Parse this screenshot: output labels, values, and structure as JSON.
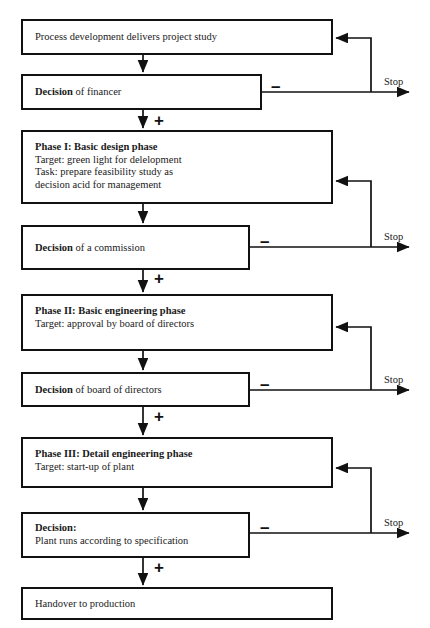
{
  "diagram": {
    "branch_positive": "+",
    "branch_negative": "−",
    "stop_label": "Stop"
  },
  "nodes": [
    {
      "id": "process-development",
      "kind": "process",
      "lines": [
        {
          "text": "Process development delivers project study",
          "bold": false
        }
      ]
    },
    {
      "id": "decision-financer",
      "kind": "decision",
      "lines": [
        {
          "text": "Decision",
          "bold": true,
          "suffix": " of financer"
        }
      ]
    },
    {
      "id": "phase-1",
      "kind": "process",
      "lines": [
        {
          "text": "Phase I: Basic design phase",
          "bold": true
        },
        {
          "text": "Target: green light for delelopment",
          "bold": false
        },
        {
          "text": "Task: prepare feasibility study as",
          "bold": false
        },
        {
          "text": "decision acid for management",
          "bold": false
        }
      ]
    },
    {
      "id": "decision-commission",
      "kind": "decision",
      "lines": [
        {
          "text": "Decision",
          "bold": true,
          "suffix": " of a commission"
        }
      ]
    },
    {
      "id": "phase-2",
      "kind": "process",
      "lines": [
        {
          "text": "Phase II: Basic engineering phase",
          "bold": true
        },
        {
          "text": "Target: approval by board of directors",
          "bold": false
        }
      ]
    },
    {
      "id": "decision-board",
      "kind": "decision",
      "lines": [
        {
          "text": "Decision",
          "bold": true,
          "suffix": " of board of directors"
        }
      ]
    },
    {
      "id": "phase-3",
      "kind": "process",
      "lines": [
        {
          "text": "Phase III: Detail engineering phase",
          "bold": true
        },
        {
          "text": "Target: start-up of plant",
          "bold": false
        }
      ]
    },
    {
      "id": "decision-plant",
      "kind": "decision",
      "lines": [
        {
          "text": "Decision:",
          "bold": true
        },
        {
          "text": "Plant runs according to specification",
          "bold": false
        }
      ]
    },
    {
      "id": "handover",
      "kind": "process",
      "lines": [
        {
          "text": "Handover to production",
          "bold": false
        }
      ]
    }
  ],
  "labels": {
    "n0": {
      "l0a": "Process development delivers project study"
    },
    "n1": {
      "l0a": "Decision",
      "l0b": " of financer"
    },
    "n2": {
      "l0a": "Phase I: Basic design phase",
      "l1a": "Target: green light for delelopment",
      "l2a": "Task: prepare feasibility study as",
      "l3a": "decision acid for management"
    },
    "n3": {
      "l0a": "Decision",
      "l0b": " of a commission"
    },
    "n4": {
      "l0a": "Phase II: Basic engineering phase",
      "l1a": "Target: approval by board of directors"
    },
    "n5": {
      "l0a": "Decision",
      "l0b": " of board of directors"
    },
    "n6": {
      "l0a": "Phase III: Detail engineering phase",
      "l1a": "Target: start-up of plant"
    },
    "n7": {
      "l0a": "Decision:",
      "l1a": "Plant runs according to specification"
    },
    "n8": {
      "l0a": "Handover to production"
    }
  },
  "signs": {
    "plus1": "+",
    "plus2": "+",
    "plus3": "+",
    "plus4": "+",
    "minus1": "–",
    "minus2": "–",
    "minus3": "–",
    "minus4": "–"
  },
  "stops": {
    "s1": "Stop",
    "s2": "Stop",
    "s3": "Stop",
    "s4": "Stop"
  },
  "colors": {
    "stroke": "#111111",
    "text": "#1a1a1a",
    "background": "#ffffff"
  }
}
